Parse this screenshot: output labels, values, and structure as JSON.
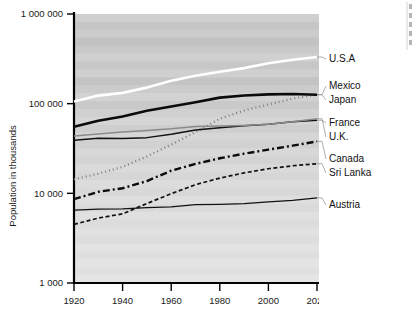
{
  "chart_data": {
    "type": "line",
    "title": "",
    "xlabel": "",
    "ylabel": "Population in thousands",
    "yscale": "log",
    "ylim": [
      1000,
      1000000
    ],
    "xlim": [
      1920,
      2020
    ],
    "grid": false,
    "plot_background": "banded-grey",
    "y_ticks": [
      "1 000 000",
      "100 000",
      "10 000",
      "1 000"
    ],
    "y_tick_values": [
      1000000,
      100000,
      10000,
      1000
    ],
    "x_ticks": [
      "1920",
      "1940",
      "1960",
      "1980",
      "2000",
      "2020"
    ],
    "x_tick_values": [
      1920,
      1940,
      1960,
      1980,
      2000,
      2020
    ],
    "legend_position": "right-inline",
    "x": [
      1920,
      1930,
      1940,
      1950,
      1960,
      1970,
      1980,
      1990,
      2000,
      2010,
      2020
    ],
    "series": [
      {
        "name": "U.S.A",
        "style": "solid-white-thick",
        "color": "#ffffff",
        "width": 2.6,
        "dash": "none",
        "label_y": 62,
        "values": [
          106000,
          123000,
          132000,
          151000,
          180000,
          205000,
          227000,
          249000,
          282000,
          309000,
          331000
        ]
      },
      {
        "name": "Mexico",
        "style": "dotted-grey",
        "color": "#7d7d7d",
        "width": 2.2,
        "dash": "1,3",
        "label_y": 89,
        "values": [
          14300,
          16600,
          19700,
          25800,
          34900,
          48200,
          67800,
          83900,
          98000,
          114000,
          126000
        ]
      },
      {
        "name": "Japan",
        "style": "solid-black-thick",
        "color": "#0b0b0b",
        "width": 2.6,
        "dash": "none",
        "label_y": 103,
        "values": [
          55400,
          64400,
          71900,
          83200,
          93200,
          103700,
          116800,
          123500,
          126800,
          128000,
          125800
        ]
      },
      {
        "name": "France",
        "style": "solid-black-thin",
        "color": "#111111",
        "width": 1.5,
        "dash": "none",
        "label_y": 126,
        "values": [
          39000,
          41200,
          41000,
          41800,
          45700,
          50800,
          53900,
          56700,
          59000,
          62800,
          65300
        ]
      },
      {
        "name": "U.K.",
        "style": "solid-grey-thin",
        "color": "#8a8a8a",
        "width": 1.5,
        "dash": "none",
        "label_y": 140,
        "values": [
          43700,
          45900,
          48200,
          50100,
          52400,
          55600,
          56300,
          57200,
          58900,
          62800,
          67900
        ]
      },
      {
        "name": "Canada",
        "style": "dash-dot-black",
        "color": "#0b0b0b",
        "width": 2.4,
        "dash": "7,3,2,3",
        "label_y": 162,
        "values": [
          8600,
          10400,
          11400,
          13700,
          17900,
          21300,
          24600,
          27700,
          30700,
          34000,
          38000
        ]
      },
      {
        "name": "Sri Lanka",
        "style": "dashed-black-fine",
        "color": "#111111",
        "width": 1.7,
        "dash": "4,2.5",
        "label_y": 176,
        "values": [
          4500,
          5300,
          5900,
          7700,
          9900,
          12500,
          14800,
          16900,
          18800,
          20300,
          21400
        ]
      },
      {
        "name": "Austria",
        "style": "solid-black-thin",
        "color": "#111111",
        "width": 1.3,
        "dash": "none",
        "label_y": 208,
        "values": [
          6500,
          6660,
          6700,
          6940,
          7050,
          7470,
          7550,
          7680,
          8010,
          8360,
          8900
        ]
      }
    ],
    "edge_cut_text": ""
  }
}
